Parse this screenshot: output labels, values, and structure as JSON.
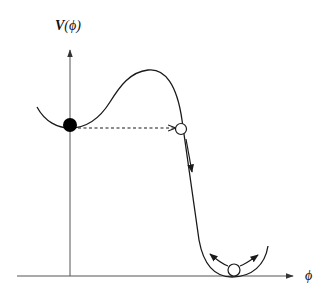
{
  "diagram": {
    "y_axis_label": "V(ϕ)",
    "y_axis_label_main": "V",
    "y_axis_label_arg": "(ϕ)",
    "x_axis_label": "ϕ",
    "colors": {
      "line": "#1a1a1a",
      "axis": "#555555",
      "ball_filled": "#000000",
      "ball_open": "#ffffff",
      "background": "#ffffff"
    },
    "elements": [
      {
        "name": "potential-curve",
        "type": "curve"
      },
      {
        "name": "false-vacuum-ball",
        "type": "filled-circle"
      },
      {
        "name": "tunneling-dashed-arrow",
        "type": "dashed-arrow"
      },
      {
        "name": "tunneled-ball",
        "type": "open-circle"
      },
      {
        "name": "roll-down-arrow",
        "type": "arrow"
      },
      {
        "name": "true-vacuum-ball",
        "type": "open-circle"
      },
      {
        "name": "oscillation-arrows",
        "type": "curved-arrows"
      }
    ]
  }
}
